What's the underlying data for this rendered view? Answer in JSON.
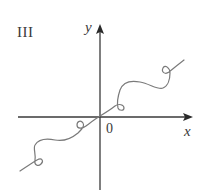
{
  "figure": {
    "panel_label": "III",
    "axes": {
      "x_label": "x",
      "y_label": "y",
      "origin_label": "0"
    },
    "colors": {
      "axis": "#3a3a3a",
      "curve": "#7a7a7a",
      "background": "#ffffff"
    },
    "curve_description": "Curve passing through origin, rising overall, with small loops near (+/-) positions and wavy oscillation"
  }
}
